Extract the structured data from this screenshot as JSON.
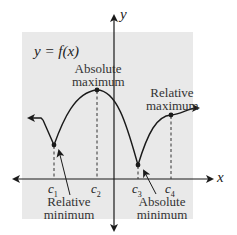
{
  "colors": {
    "panel_bg": "#e9e9e9",
    "curve": "#1a1a1a",
    "axis": "#1a1a1a",
    "text": "#333333"
  },
  "equation": "y = f(x)",
  "axes": {
    "x_label": "x",
    "y_label": "y"
  },
  "ticks": [
    {
      "base": "c",
      "sub": "1"
    },
    {
      "base": "c",
      "sub": "2"
    },
    {
      "base": "c",
      "sub": "3"
    },
    {
      "base": "c",
      "sub": "4"
    }
  ],
  "annotations": {
    "absolute_maximum": {
      "line1": "Absolute",
      "line2": "maximum"
    },
    "relative_maximum": {
      "line1": "Relative",
      "line2": "maximum"
    },
    "relative_minimum": {
      "line1": "Relative",
      "line2": "minimum"
    },
    "absolute_minimum": {
      "line1": "Absolute",
      "line2": "minimum"
    }
  },
  "extrema_points": [
    {
      "name": "Relative minimum",
      "at": "c1"
    },
    {
      "name": "Absolute maximum",
      "at": "c2"
    },
    {
      "name": "Absolute minimum",
      "at": "c3"
    },
    {
      "name": "Relative maximum",
      "at": "c4"
    }
  ]
}
